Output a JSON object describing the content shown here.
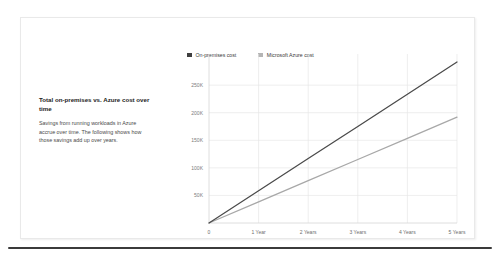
{
  "card": {
    "panel": {
      "title": "Total on-premises vs. Azure cost over time",
      "body": "Savings from running workloads in Azure accrue over time. The following shows how those savings add up over years."
    }
  },
  "bottom_rule": {
    "name": "horizontal-rule"
  },
  "chart_data": {
    "type": "line",
    "title": "",
    "xlabel": "",
    "ylabel": "",
    "grid": true,
    "legend_position": "top",
    "x": [
      0,
      1,
      2,
      3,
      4,
      5
    ],
    "categories": [
      "0",
      "1 Year",
      "2 Years",
      "3 Years",
      "4 Years",
      "5 Years"
    ],
    "xtick_labels": [
      "0",
      "1 Year",
      "2 Years",
      "3 Years",
      "4 Years",
      "5 Years"
    ],
    "ytick_labels": [
      "50K",
      "100K",
      "150K",
      "200K",
      "250K"
    ],
    "ytick_values": [
      50000,
      100000,
      150000,
      200000,
      250000
    ],
    "ylim": [
      0,
      292000
    ],
    "xlim": [
      0,
      5
    ],
    "series": [
      {
        "name": "On-premises cost",
        "color": "#4a4a4a",
        "values": [
          0,
          58400,
          116800,
          175200,
          233600,
          292000
        ]
      },
      {
        "name": "Microsoft Azure cost",
        "color": "#a8a8a8",
        "values": [
          0,
          38400,
          76800,
          115200,
          153600,
          192000
        ]
      }
    ],
    "legend": [
      {
        "label": "On-premises cost",
        "color": "#3f3f3f"
      },
      {
        "label": "Microsoft Azure cost",
        "color": "#b5b5b5"
      }
    ]
  }
}
